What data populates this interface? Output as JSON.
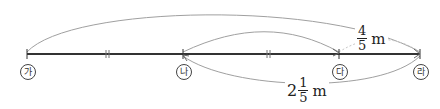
{
  "diagram": {
    "type": "number-line-distance",
    "points": [
      {
        "id": "ga",
        "label": "가",
        "x": 27
      },
      {
        "id": "na",
        "label": "나",
        "x": 183
      },
      {
        "id": "da",
        "label": "다",
        "x": 339
      },
      {
        "id": "ra",
        "label": "라",
        "x": 420
      }
    ],
    "equal_marks": {
      "symbol": "||",
      "segments": [
        "가-나",
        "나-다"
      ]
    },
    "arcs": [
      {
        "from": "가",
        "to": "라",
        "position": "top",
        "label": ""
      },
      {
        "from": "나",
        "to": "다",
        "position": "top",
        "label": ""
      },
      {
        "from": "다",
        "to": "라",
        "position": "top",
        "label": "4/5 m"
      },
      {
        "from": "나",
        "to": "라",
        "position": "bottom",
        "label": "2 1/5 m"
      }
    ],
    "labels": {
      "da_ra": {
        "whole": "",
        "num": "4",
        "den": "5",
        "unit": "m"
      },
      "na_ra": {
        "whole": "2",
        "num": "1",
        "den": "5",
        "unit": "m"
      }
    },
    "colors": {
      "line": "#333333",
      "arc": "#999999",
      "text": "#222222"
    }
  }
}
